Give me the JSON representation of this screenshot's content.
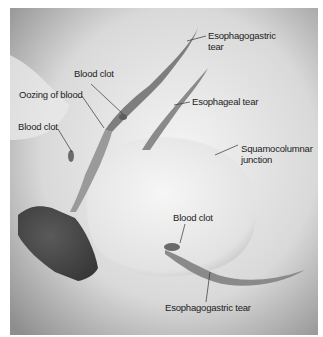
{
  "figure": {
    "labels": {
      "esophagogastric_tear_top_line1": "Esophagogastric",
      "esophagogastric_tear_top_line2": "tear",
      "blood_clot_top": "Blood clot",
      "oozing_of_blood": "Oozing of blood",
      "blood_clot_left": "Blood clot",
      "esophageal_tear": "Esophageal tear",
      "squamocolumnar_line1": "Squamocolumnar",
      "squamocolumnar_line2": "junction",
      "blood_clot_bottom": "Blood clot",
      "esophagogastric_tear_bottom": "Esophagogastric tear"
    },
    "colors": {
      "background_light": "#efefef",
      "background_dark": "#8a8a8a",
      "tissue": "#e6e6e6",
      "lumen": "#4a4a4a",
      "tear": "#7a7a7a"
    }
  }
}
